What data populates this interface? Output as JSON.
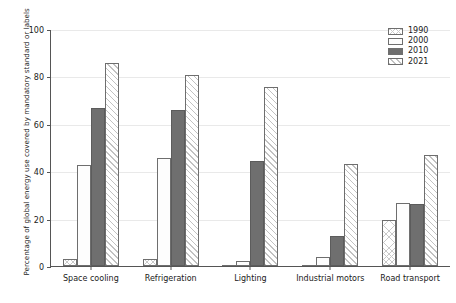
{
  "chart_data": {
    "type": "bar",
    "title": "",
    "subtitle": "",
    "xlabel": "",
    "ylabel": "Percentage of global energy use covered by mandatory standard or labels",
    "ylim": [
      0,
      100
    ],
    "yticks": [
      0,
      20,
      40,
      60,
      80,
      100
    ],
    "grid": true,
    "legend_position": "top-right",
    "categories": [
      "Space cooling",
      "Refrigeration",
      "Lighting",
      "Industrial motors",
      "Road transport"
    ],
    "series": [
      {
        "name": "1990",
        "values": [
          3,
          3,
          0,
          0,
          19.5
        ]
      },
      {
        "name": "2000",
        "values": [
          42.5,
          45.5,
          2,
          4,
          26.5
        ]
      },
      {
        "name": "2010",
        "values": [
          66.5,
          66,
          44.5,
          12.5,
          26
        ]
      },
      {
        "name": "2021",
        "values": [
          85.5,
          80.5,
          75.5,
          43,
          47
        ]
      }
    ]
  },
  "legend": {
    "items": [
      {
        "label": "1990",
        "pattern": "cross-hatch"
      },
      {
        "label": "2000",
        "pattern": "dotted"
      },
      {
        "label": "2010",
        "pattern": "solid-dark-gray"
      },
      {
        "label": "2021",
        "pattern": "diagonal-hatch"
      }
    ]
  },
  "colors": {
    "series_2010_fill": "#6f6f6f",
    "bar_outline": "#6e6e6e",
    "axis": "#555555",
    "gridline": "#e9e9e9",
    "text": "#1a1a1a",
    "background": "#ffffff"
  }
}
